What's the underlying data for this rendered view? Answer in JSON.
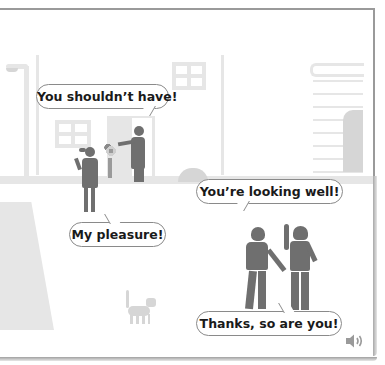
{
  "scene": {
    "description": "Street scene with two dialogues",
    "colors": {
      "background": "#ffffff",
      "building": "#e6e6e6",
      "figure": "#6f6f6f",
      "bubble_border": "#8a8a8a",
      "frame": "#9a9a9a"
    }
  },
  "dialogues": [
    {
      "id": "doorway",
      "lines": [
        {
          "speaker": "woman-at-door",
          "text": "You shouldn’t have!"
        },
        {
          "speaker": "girl-with-flowers",
          "text": "My pleasure!"
        }
      ]
    },
    {
      "id": "street",
      "lines": [
        {
          "speaker": "left-person",
          "text": "You’re looking well!"
        },
        {
          "speaker": "right-person",
          "text": "Thanks, so are you!"
        }
      ]
    }
  ],
  "audio": {
    "icon": "speaker-icon",
    "label": "Play audio"
  }
}
